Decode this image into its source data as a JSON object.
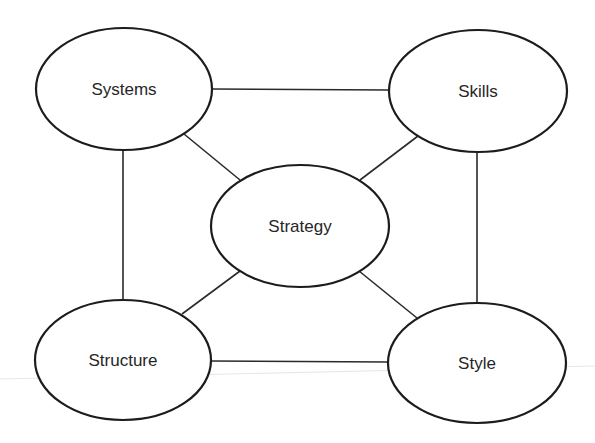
{
  "diagram": {
    "type": "network",
    "colors": {
      "stroke": "#1c1c1c",
      "text": "#262626",
      "background": "#ffffff"
    },
    "nodes": {
      "systems": {
        "label": "Systems",
        "cx": 124,
        "cy": 89,
        "rx": 88,
        "ry": 61
      },
      "skills": {
        "label": "Skills",
        "cx": 478,
        "cy": 91,
        "rx": 89,
        "ry": 61
      },
      "strategy": {
        "label": "Strategy",
        "cx": 300,
        "cy": 226,
        "rx": 89,
        "ry": 61
      },
      "structure": {
        "label": "Structure",
        "cx": 123,
        "cy": 360,
        "rx": 88,
        "ry": 60
      },
      "style": {
        "label": "Style",
        "cx": 477,
        "cy": 363,
        "rx": 89,
        "ry": 60
      }
    },
    "edges": [
      {
        "from": "Systems",
        "to": "Skills"
      },
      {
        "from": "Systems",
        "to": "Structure"
      },
      {
        "from": "Systems",
        "to": "Strategy"
      },
      {
        "from": "Skills",
        "to": "Style"
      },
      {
        "from": "Skills",
        "to": "Strategy"
      },
      {
        "from": "Structure",
        "to": "Style"
      },
      {
        "from": "Structure",
        "to": "Strategy"
      },
      {
        "from": "Style",
        "to": "Strategy"
      }
    ]
  }
}
